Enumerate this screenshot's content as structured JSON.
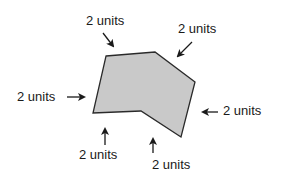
{
  "diagram": {
    "shape": {
      "type": "concave hexagon",
      "fill": "#c9c9c9",
      "stroke": "#2a2a2a",
      "points": "106,56 155,52 195,82 181,137 141,111 93,113"
    },
    "labels": [
      {
        "id": "top-left",
        "text": "2 units"
      },
      {
        "id": "top-right",
        "text": "2 units"
      },
      {
        "id": "left",
        "text": "2 units"
      },
      {
        "id": "right",
        "text": "2 units"
      },
      {
        "id": "bottom-left",
        "text": "2 units"
      },
      {
        "id": "bottom-right",
        "text": "2 units"
      }
    ],
    "arrow_color": "#1a1a1a"
  }
}
